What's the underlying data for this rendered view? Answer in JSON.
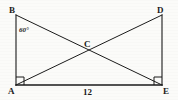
{
  "figure": {
    "background_color": "#fbfbf9",
    "stroke_color": "#1b1b1b",
    "type": "geometry-diagram"
  },
  "vertices": {
    "A": {
      "label": "A",
      "x": 14,
      "y": 84
    },
    "B": {
      "label": "B",
      "x": 14,
      "y": 12
    },
    "D": {
      "label": "D",
      "x": 163,
      "y": 12
    },
    "E": {
      "label": "E",
      "x": 163,
      "y": 84
    },
    "C": {
      "label": "C",
      "x": 88,
      "y": 48
    }
  },
  "labels": {
    "a": "A",
    "b": "B",
    "c": "C",
    "d": "D",
    "e": "E"
  },
  "annotations": {
    "angle_at_b": "60°",
    "base_length": "12"
  },
  "segments": [
    {
      "name": "AB",
      "from": "A",
      "to": "B"
    },
    {
      "name": "AE",
      "from": "A",
      "to": "E"
    },
    {
      "name": "DE",
      "from": "D",
      "to": "E"
    },
    {
      "name": "BE",
      "from": "B",
      "to": "E"
    },
    {
      "name": "AD",
      "from": "A",
      "to": "D"
    }
  ],
  "right_angles": [
    {
      "at": "A",
      "marker": "square"
    },
    {
      "at": "E",
      "marker": "square"
    }
  ]
}
